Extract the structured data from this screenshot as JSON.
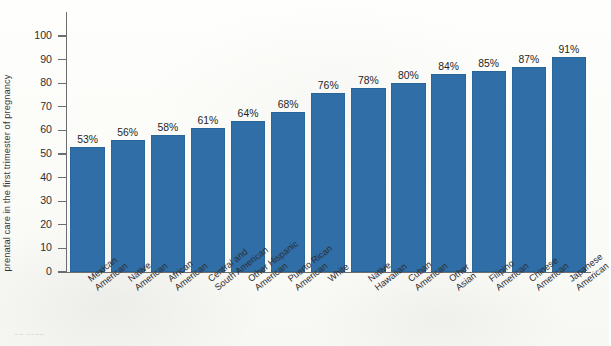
{
  "chart_data": {
    "type": "bar",
    "title": "",
    "xlabel": "",
    "ylabel_line1": "Percentage of pregnant women who obtain",
    "ylabel_line2": "prenatal care in the first trimester of pregnancy",
    "ylim": [
      0,
      100
    ],
    "ytick_step": 10,
    "yticks": [
      0,
      10,
      20,
      30,
      40,
      50,
      60,
      70,
      80,
      90,
      100
    ],
    "grid": false,
    "legend": "none",
    "bar_color": "#2f6ea6",
    "categories": [
      "Mexican American",
      "Native American",
      "African American",
      "Central and South American",
      "Other Hispanic American",
      "Puerto Rican American",
      "White",
      "Native Hawaiian",
      "Cuban American",
      "Other Asian",
      "Filipino American",
      "Chinese American",
      "Japanese American"
    ],
    "category_lines": [
      [
        "Mexican",
        "American"
      ],
      [
        "Native",
        "American"
      ],
      [
        "African",
        "American"
      ],
      [
        "Central and",
        "South American"
      ],
      [
        "Other Hispanic",
        "American"
      ],
      [
        "Puerto Rican",
        "American"
      ],
      [
        "White"
      ],
      [
        "Native",
        "Hawaiian"
      ],
      [
        "Cuban",
        "American"
      ],
      [
        "Other",
        "Asian"
      ],
      [
        "Filipino",
        "American"
      ],
      [
        "Chinese",
        "American"
      ],
      [
        "Japanese",
        "American"
      ]
    ],
    "values": [
      53,
      56,
      58,
      61,
      64,
      68,
      76,
      78,
      80,
      84,
      85,
      87,
      91
    ],
    "value_labels": [
      "53%",
      "56%",
      "58%",
      "61%",
      "64%",
      "68%",
      "76%",
      "78%",
      "80%",
      "84%",
      "85%",
      "87%",
      "91%"
    ]
  }
}
